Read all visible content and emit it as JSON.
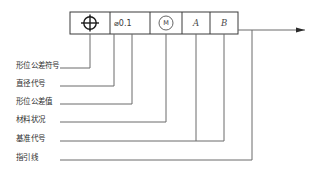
{
  "diagram": {
    "accent_color": "#3a3a3a",
    "line_color": "#6b6b6b",
    "background": "#ffffff"
  },
  "tolerance_frame": {
    "cells": [
      {
        "key": "symbol",
        "icon": "position-tolerance-icon",
        "value": "⌖",
        "label": "位置度符号"
      },
      {
        "key": "tolerance_value",
        "icon": "diameter-icon",
        "value": "⌀0.1",
        "label": "直径公差值"
      },
      {
        "key": "material_condition",
        "icon": "mmc-circled-m-icon",
        "value": "M",
        "label": "最大实体状态"
      },
      {
        "key": "datum_primary",
        "icon": "datum-letter-icon",
        "value": "A",
        "label": "基准 A"
      },
      {
        "key": "datum_secondary",
        "icon": "datum-letter-icon",
        "value": "B",
        "label": "基准 B"
      }
    ]
  },
  "callouts": [
    {
      "id": "c1",
      "text": "形位公差符号"
    },
    {
      "id": "c2",
      "text": "直径代号"
    },
    {
      "id": "c3",
      "text": "形位公差值"
    },
    {
      "id": "c4",
      "text": "材料状况"
    },
    {
      "id": "c5",
      "text": "基准代号"
    },
    {
      "id": "c6",
      "text": "指引线"
    }
  ],
  "leader": {
    "name": "leader-arrow",
    "direction": "right"
  }
}
